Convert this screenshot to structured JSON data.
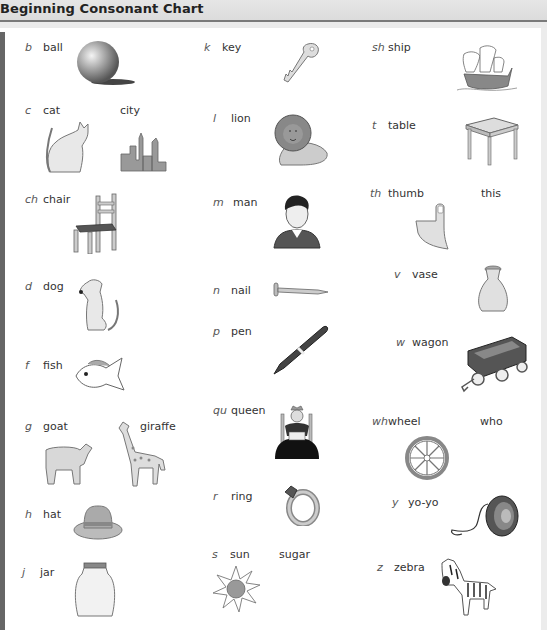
{
  "title": "Beginning Consonant Chart",
  "columns": [
    {
      "entries": [
        {
          "letter": "b",
          "word": "ball",
          "icon": "ball-icon"
        },
        {
          "letter": "c",
          "word": "cat",
          "extra_word": "city",
          "icon": "cat-icon",
          "extra_icon": "city-icon"
        },
        {
          "letter": "ch",
          "word": "chair",
          "icon": "chair-icon"
        },
        {
          "letter": "d",
          "word": "dog",
          "icon": "dog-icon"
        },
        {
          "letter": "f",
          "word": "fish",
          "icon": "fish-icon"
        },
        {
          "letter": "g",
          "word": "goat",
          "extra_word": "giraffe",
          "icon": "goat-icon",
          "extra_icon": "giraffe-icon"
        },
        {
          "letter": "h",
          "word": "hat",
          "icon": "hat-icon"
        },
        {
          "letter": "j",
          "word": "jar",
          "icon": "jar-icon"
        }
      ]
    },
    {
      "entries": [
        {
          "letter": "k",
          "word": "key",
          "icon": "key-icon"
        },
        {
          "letter": "l",
          "word": "lion",
          "icon": "lion-icon"
        },
        {
          "letter": "m",
          "word": "man",
          "icon": "man-icon"
        },
        {
          "letter": "n",
          "word": "nail",
          "icon": "nail-icon"
        },
        {
          "letter": "p",
          "word": "pen",
          "icon": "pen-icon"
        },
        {
          "letter": "qu",
          "word": "queen",
          "icon": "queen-icon"
        },
        {
          "letter": "r",
          "word": "ring",
          "icon": "ring-icon"
        },
        {
          "letter": "s",
          "word": "sun",
          "extra_word": "sugar",
          "icon": "sun-icon"
        }
      ]
    },
    {
      "entries": [
        {
          "letter": "sh",
          "word": "ship",
          "icon": "ship-icon"
        },
        {
          "letter": "t",
          "word": "table",
          "icon": "table-icon"
        },
        {
          "letter": "th",
          "word": "thumb",
          "extra_word": "this",
          "icon": "thumb-icon"
        },
        {
          "letter": "v",
          "word": "vase",
          "icon": "vase-icon"
        },
        {
          "letter": "w",
          "word": "wagon",
          "icon": "wagon-icon"
        },
        {
          "letter": "wh",
          "word": "wheel",
          "extra_word": "who",
          "icon": "wheel-icon"
        },
        {
          "letter": "y",
          "word": "yo-yo",
          "icon": "yoyo-icon"
        },
        {
          "letter": "z",
          "word": "zebra",
          "icon": "zebra-icon"
        }
      ]
    }
  ]
}
